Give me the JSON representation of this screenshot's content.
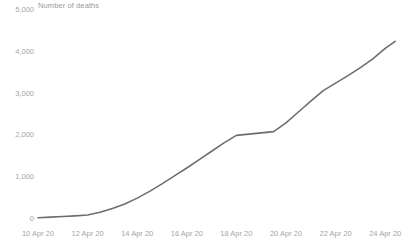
{
  "chart_data": {
    "type": "line",
    "title": "Number of deaths",
    "xlabel": "",
    "ylabel": "",
    "ylim": [
      0,
      5000
    ],
    "grid": false,
    "legend": "none",
    "line_color": "#6e6e6e",
    "tick_color": "#a6a6a6",
    "title_color": "#9a9a9a",
    "background": "#ffffff",
    "y_ticks": [
      "5,000",
      "4,000",
      "3,000",
      "2,000",
      "1,000",
      "0"
    ],
    "y_tick_values": [
      5000,
      4000,
      3000,
      2000,
      1000,
      0
    ],
    "x_ticks": [
      "10 Apr 20",
      "12 Apr 20",
      "14 Apr 20",
      "16 Apr 20",
      "18 Apr 20",
      "20 Apr 20",
      "22 Apr 20",
      "24 Apr 20"
    ],
    "x_tick_values": [
      10,
      12,
      14,
      16,
      18,
      20,
      22,
      24
    ],
    "xlim": [
      10,
      24.4
    ],
    "x": [
      10,
      10.5,
      11,
      11.5,
      12,
      12.5,
      13,
      13.5,
      14,
      14.5,
      15,
      15.5,
      16,
      16.5,
      17,
      17.5,
      18,
      18.5,
      19,
      19.5,
      20,
      20.5,
      21,
      21.5,
      22,
      22.5,
      23,
      23.5,
      24,
      24.4
    ],
    "values": [
      30,
      45,
      60,
      75,
      95,
      160,
      250,
      360,
      500,
      660,
      840,
      1030,
      1220,
      1420,
      1620,
      1820,
      2000,
      2030,
      2060,
      2090,
      2300,
      2560,
      2820,
      3070,
      3250,
      3430,
      3620,
      3830,
      4080,
      4250
    ],
    "series": [
      {
        "name": "Number of deaths",
        "values": [
          30,
          45,
          60,
          75,
          95,
          160,
          250,
          360,
          500,
          660,
          840,
          1030,
          1220,
          1420,
          1620,
          1820,
          2000,
          2030,
          2060,
          2090,
          2300,
          2560,
          2820,
          3070,
          3250,
          3430,
          3620,
          3830,
          4080,
          4250
        ]
      }
    ]
  }
}
